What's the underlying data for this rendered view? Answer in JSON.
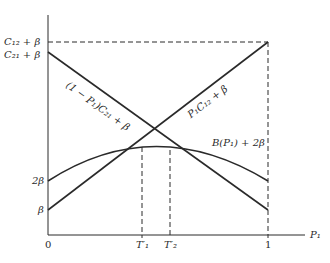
{
  "diagram": {
    "type": "cost-curves",
    "x_axis": {
      "label": "P₁",
      "ticks": [
        "0",
        "T′₁",
        "T′₂",
        "1"
      ]
    },
    "y_axis": {
      "ticks": [
        "C₁₂ + β",
        "C₂₁ + β",
        "2β",
        "β"
      ]
    },
    "curves": [
      {
        "name": "decreasing-line",
        "label": "(1 − P₁)C₂₁ + β",
        "from": "C₂₁ + β at P₁=0",
        "to": "β at P₁=1"
      },
      {
        "name": "increasing-line",
        "label": "P₁C₁₂ + β",
        "from": "β at P₁=0",
        "to": "C₁₂ + β at P₁=1"
      },
      {
        "name": "concave-curve",
        "label": "B(P₁) + 2β",
        "from": "2β at P₁=0",
        "to": "2β at P₁=1"
      }
    ],
    "colors": {
      "line": "#2a2a2a",
      "background": "#ffffff"
    }
  }
}
